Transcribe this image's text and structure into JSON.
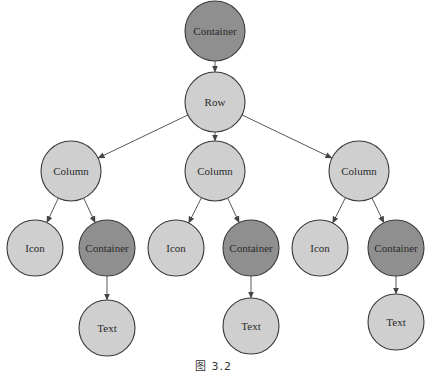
{
  "diagram": {
    "type": "tree",
    "caption": "图 3.2",
    "colors": {
      "light_node": "#cfcfcf",
      "dark_node": "#8f8f8f",
      "stroke": "#3a3a3a",
      "edge": "#444444"
    },
    "nodes": [
      {
        "id": "container-root",
        "label": "Container",
        "style": "dark",
        "cx": 215,
        "cy": 31,
        "r": 30
      },
      {
        "id": "row",
        "label": "Row",
        "style": "light",
        "cx": 215,
        "cy": 102,
        "r": 30
      },
      {
        "id": "column-1",
        "label": "Column",
        "style": "light",
        "cx": 71,
        "cy": 171,
        "r": 30
      },
      {
        "id": "column-2",
        "label": "Column",
        "style": "light",
        "cx": 215,
        "cy": 171,
        "r": 30
      },
      {
        "id": "column-3",
        "label": "Column",
        "style": "light",
        "cx": 359,
        "cy": 171,
        "r": 30
      },
      {
        "id": "icon-1",
        "label": "Icon",
        "style": "light",
        "cx": 35,
        "cy": 248,
        "r": 28
      },
      {
        "id": "container-1",
        "label": "Container",
        "style": "dark",
        "cx": 107,
        "cy": 248,
        "r": 28
      },
      {
        "id": "icon-2",
        "label": "Icon",
        "style": "light",
        "cx": 176,
        "cy": 248,
        "r": 28
      },
      {
        "id": "container-2",
        "label": "Container",
        "style": "dark",
        "cx": 251,
        "cy": 248,
        "r": 28
      },
      {
        "id": "icon-3",
        "label": "Icon",
        "style": "light",
        "cx": 320,
        "cy": 248,
        "r": 28
      },
      {
        "id": "container-3",
        "label": "Container",
        "style": "dark",
        "cx": 396,
        "cy": 248,
        "r": 28
      },
      {
        "id": "text-1",
        "label": "Text",
        "style": "light",
        "cx": 107,
        "cy": 328,
        "r": 28
      },
      {
        "id": "text-2",
        "label": "Text",
        "style": "light",
        "cx": 251,
        "cy": 326,
        "r": 28
      },
      {
        "id": "text-3",
        "label": "Text",
        "style": "light",
        "cx": 396,
        "cy": 322,
        "r": 28
      }
    ],
    "edges": [
      {
        "from": "container-root",
        "to": "row"
      },
      {
        "from": "row",
        "to": "column-1"
      },
      {
        "from": "row",
        "to": "column-2"
      },
      {
        "from": "row",
        "to": "column-3"
      },
      {
        "from": "column-1",
        "to": "icon-1"
      },
      {
        "from": "column-1",
        "to": "container-1"
      },
      {
        "from": "column-2",
        "to": "icon-2"
      },
      {
        "from": "column-2",
        "to": "container-2"
      },
      {
        "from": "column-3",
        "to": "icon-3"
      },
      {
        "from": "column-3",
        "to": "container-3"
      },
      {
        "from": "container-1",
        "to": "text-1"
      },
      {
        "from": "container-2",
        "to": "text-2"
      },
      {
        "from": "container-3",
        "to": "text-3"
      }
    ]
  }
}
